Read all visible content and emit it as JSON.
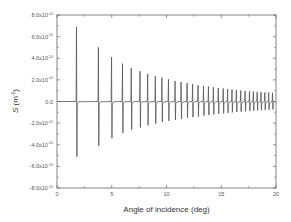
{
  "chart_data": {
    "type": "line",
    "title": "",
    "xlabel": "Angle of incidence (deg)",
    "ylabel": "S (m⁻¹)",
    "xlim": [
      0,
      20
    ],
    "ylim": [
      -8e-10,
      8e-10
    ],
    "grid": false,
    "legend": null,
    "x_ticks": [
      0,
      5,
      10,
      15,
      20
    ],
    "x_tick_labels": [
      "0",
      "5",
      "10",
      "15",
      "20"
    ],
    "y_ticks": [
      8e-10,
      6e-10,
      4e-10,
      2e-10,
      0,
      -2e-10,
      -4e-10,
      -6e-10,
      -8e-10
    ],
    "y_tick_labels": [
      {
        "mant": "8.0x10",
        "exp": "-10"
      },
      {
        "mant": "6.0x10",
        "exp": "-10"
      },
      {
        "mant": "4.0x10",
        "exp": "-10"
      },
      {
        "mant": "2.0x10",
        "exp": "-10"
      },
      {
        "mant": "0.0",
        "exp": ""
      },
      {
        "mant": "-2.0x10",
        "exp": "-10"
      },
      {
        "mant": "-4.0x10",
        "exp": "-10"
      },
      {
        "mant": "-6.0x10",
        "exp": "-10"
      },
      {
        "mant": "-8.0x10",
        "exp": "-10"
      }
    ],
    "series": [
      {
        "name": "S",
        "color": "#555555",
        "description": "Resonance spikes: sharp positive peak followed by negative dip at each angle, amplitudes decaying with angle",
        "spikes": [
          {
            "x": 1.8,
            "max": 6.9e-10,
            "min": -5.1e-10
          },
          {
            "x": 3.8,
            "max": 5e-10,
            "min": -4.1e-10
          },
          {
            "x": 5.0,
            "max": 4.1e-10,
            "min": -3.4e-10
          },
          {
            "x": 6.0,
            "max": 3.5e-10,
            "min": -2.9e-10
          },
          {
            "x": 6.8,
            "max": 3.1e-10,
            "min": -2.6e-10
          },
          {
            "x": 7.6,
            "max": 2.8e-10,
            "min": -2.4e-10
          },
          {
            "x": 8.3,
            "max": 2.55e-10,
            "min": -2.2e-10
          },
          {
            "x": 9.0,
            "max": 2.35e-10,
            "min": -2.05e-10
          },
          {
            "x": 9.6,
            "max": 2.2e-10,
            "min": -1.9e-10
          },
          {
            "x": 10.2,
            "max": 2.05e-10,
            "min": -1.8e-10
          },
          {
            "x": 10.8,
            "max": 1.9e-10,
            "min": -1.7e-10
          },
          {
            "x": 11.35,
            "max": 1.8e-10,
            "min": -1.6e-10
          },
          {
            "x": 11.9,
            "max": 1.7e-10,
            "min": -1.5e-10
          },
          {
            "x": 12.4,
            "max": 1.6e-10,
            "min": -1.45e-10
          },
          {
            "x": 12.9,
            "max": 1.5e-10,
            "min": -1.4e-10
          },
          {
            "x": 13.4,
            "max": 1.45e-10,
            "min": -1.3e-10
          },
          {
            "x": 13.85,
            "max": 1.38e-10,
            "min": -1.25e-10
          },
          {
            "x": 14.3,
            "max": 1.32e-10,
            "min": -1.2e-10
          },
          {
            "x": 14.75,
            "max": 1.26e-10,
            "min": -1.15e-10
          },
          {
            "x": 15.2,
            "max": 1.2e-10,
            "min": -1.1e-10
          },
          {
            "x": 15.6,
            "max": 1.15e-10,
            "min": -1.05e-10
          },
          {
            "x": 16.0,
            "max": 1.1e-10,
            "min": -1e-10
          },
          {
            "x": 16.4,
            "max": 1.06e-10,
            "min": -9.7e-11
          },
          {
            "x": 16.8,
            "max": 1.02e-10,
            "min": -9.4e-11
          },
          {
            "x": 17.2,
            "max": 9.8e-11,
            "min": -9e-11
          },
          {
            "x": 17.6,
            "max": 9.5e-11,
            "min": -8.7e-11
          },
          {
            "x": 17.95,
            "max": 9.2e-11,
            "min": -8.4e-11
          },
          {
            "x": 18.3,
            "max": 8.9e-11,
            "min": -8.2e-11
          },
          {
            "x": 18.65,
            "max": 8.6e-11,
            "min": -8e-11
          },
          {
            "x": 19.0,
            "max": 8.4e-11,
            "min": -7.8e-11
          },
          {
            "x": 19.35,
            "max": 8.2e-11,
            "min": -7.6e-11
          },
          {
            "x": 19.7,
            "max": 8e-11,
            "min": -7.4e-11
          }
        ]
      }
    ]
  }
}
